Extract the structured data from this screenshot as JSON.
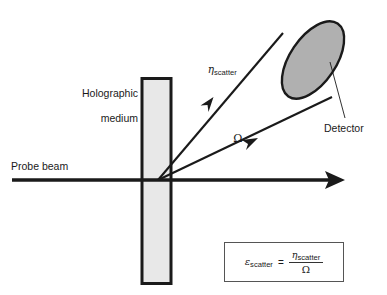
{
  "figure": {
    "background_color": "#ffffff",
    "line_color": "#1a1a1a"
  },
  "labels": {
    "medium_line1": "Holographic",
    "medium_line2": "medium",
    "probe_beam": "Probe beam",
    "detector": "Detector",
    "eta_symbol": "η",
    "eta_subscript": "scatter",
    "omega_symbol": "Ω"
  },
  "formula": {
    "lhs_symbol": "ε",
    "lhs_subscript": "scatter",
    "equals": "=",
    "numerator_symbol": "η",
    "numerator_subscript": "scatter",
    "denominator_symbol": "Ω"
  },
  "shapes": {
    "medium_rect": {
      "fill": "#e8e8e8",
      "stroke": "#1a1a1a",
      "x": 141,
      "y": 77,
      "width": 31,
      "height": 208
    },
    "detector_ellipse": {
      "fill": "#b0b0b0",
      "stroke": "#1a1a1a",
      "cx": 313,
      "cy": 60,
      "rx": 44,
      "ry": 23,
      "rotation_deg": -56
    },
    "probe_beam_line": {
      "x1": 12,
      "y1": 180,
      "x2": 345,
      "y2": 180,
      "arrowhead": "right"
    },
    "scatter_ray_upper": {
      "x1": 158,
      "y1": 180,
      "x2": 283,
      "y2": 33,
      "arrowhead": "mid"
    },
    "scatter_ray_lower": {
      "x1": 158,
      "y1": 180,
      "x2": 332,
      "y2": 97,
      "arrowhead": "mid"
    },
    "detector_leader_line": {
      "x1": 332,
      "y1": 97,
      "x2": 348,
      "y2": 120
    }
  }
}
